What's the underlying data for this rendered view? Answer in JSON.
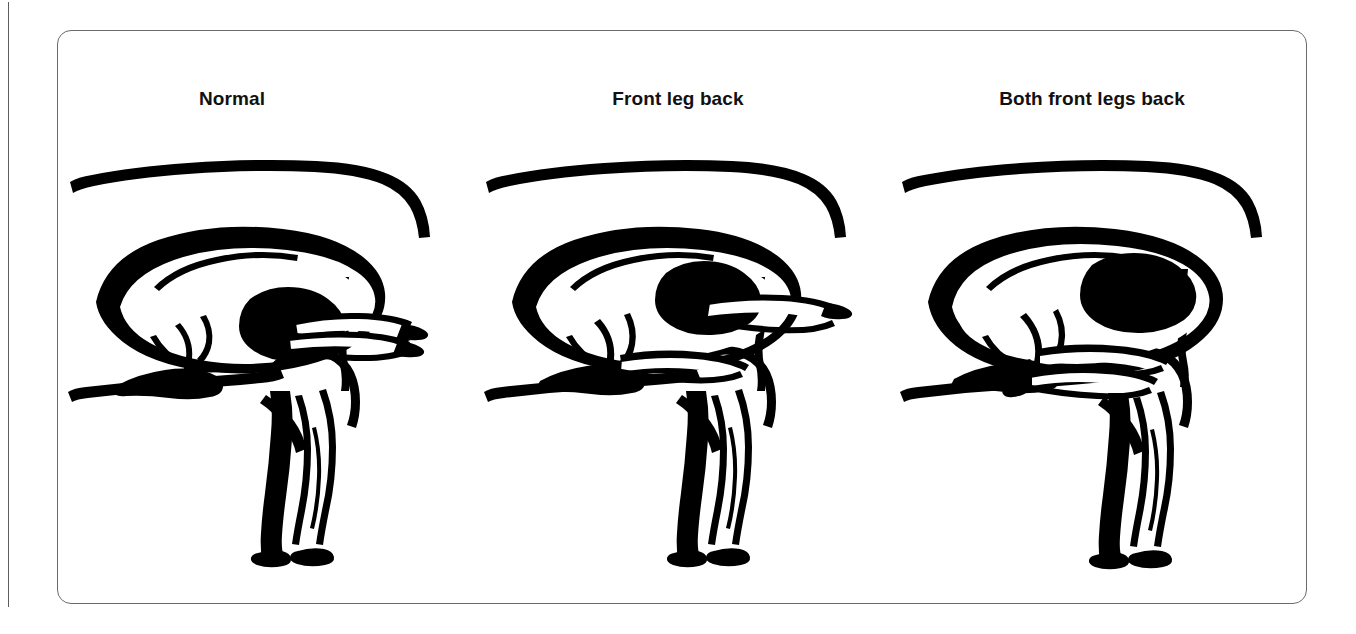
{
  "figure": {
    "caption_present": false,
    "frame": {
      "border_color": "#6b6b6b",
      "background_color": "#ffffff",
      "corner_radius_px": 14
    },
    "page_edge_rule_color": "#5d5d5d",
    "ink_color": "#000000"
  },
  "panels": [
    {
      "id": "normal",
      "label": "Normal",
      "lamb_head_out": true,
      "forelegs_out": 2,
      "forelegs_back": 0
    },
    {
      "id": "front-leg-back",
      "label": "Front leg back",
      "lamb_head_out": true,
      "forelegs_out": 1,
      "forelegs_back": 1
    },
    {
      "id": "both-front-legs-back",
      "label": "Both front legs back",
      "lamb_head_out": true,
      "forelegs_out": 0,
      "forelegs_back": 2
    }
  ]
}
